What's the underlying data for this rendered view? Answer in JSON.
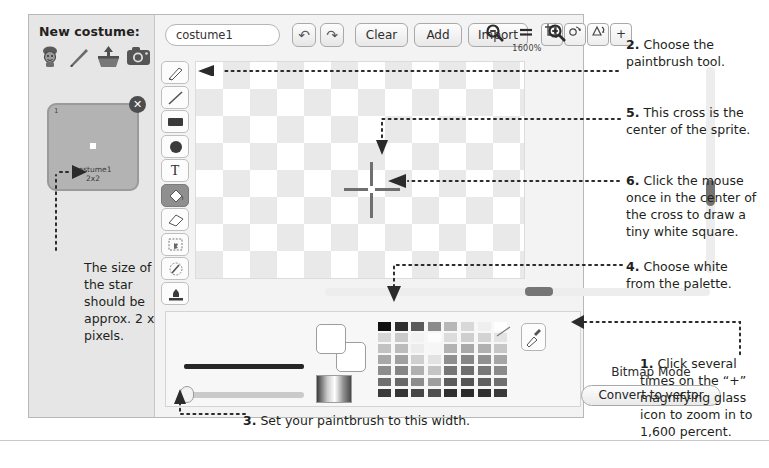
{
  "panel": {
    "new_costume_label": "New costume:",
    "icons": [
      {
        "name": "costume-library-icon",
        "label": "Choose costume from library"
      },
      {
        "name": "paint-costume-icon",
        "label": "Paint new costume"
      },
      {
        "name": "upload-costume-icon",
        "label": "Upload costume from file"
      },
      {
        "name": "camera-costume-icon",
        "label": "New costume from camera"
      }
    ],
    "thumbnail": {
      "number": "1",
      "name": "costume1",
      "size": "2x2",
      "delete_label": "✕"
    },
    "size_note": "The size of the star should be approx. 2 x 2 pixels."
  },
  "toolbar": {
    "costume_name_value": "costume1",
    "costume_name_placeholder": "costume1",
    "undo_label": "↶",
    "redo_label": "↷",
    "clear_label": "Clear",
    "add_label": "Add",
    "import_label": "Import",
    "crop_label": "⌧",
    "flip_h_label": "↺",
    "flip_v_label": "↻",
    "center_label": "+"
  },
  "tools": [
    {
      "id": "paintbrush",
      "label": "Paintbrush",
      "selected": false,
      "glyph": "brush"
    },
    {
      "id": "line",
      "label": "Line",
      "selected": false,
      "glyph": "line"
    },
    {
      "id": "rectangle",
      "label": "Rectangle",
      "selected": false,
      "glyph": "rect"
    },
    {
      "id": "ellipse",
      "label": "Ellipse",
      "selected": false,
      "glyph": "ellipse"
    },
    {
      "id": "text",
      "label": "Text",
      "selected": false,
      "glyph": "T"
    },
    {
      "id": "fill",
      "label": "Fill with color",
      "selected": true,
      "glyph": "bucket"
    },
    {
      "id": "eraser",
      "label": "Eraser",
      "selected": false,
      "glyph": "eraser"
    },
    {
      "id": "select",
      "label": "Select",
      "selected": false,
      "glyph": "select"
    },
    {
      "id": "magic-wand",
      "label": "Select and duplicate",
      "selected": false,
      "glyph": "wand"
    },
    {
      "id": "stamp",
      "label": "Stamp",
      "selected": false,
      "glyph": "stamp"
    }
  ],
  "canvas": {
    "zoom_level": "1600%",
    "mode_label": "Bitmap Mode",
    "convert_label": "Convert to vector",
    "zoom_out_label": "−",
    "zoom_reset_label": "=",
    "zoom_in_label": "+"
  },
  "palette": {
    "colors": [
      [
        "#111111",
        "#2e2e2e",
        "#5b5b5b",
        "#8a8a8a",
        "#b7b7b7",
        "#d8d8d8",
        "#efefef",
        "#ffffff"
      ],
      [
        "#d6d6d6",
        "#c9c9c9",
        "#f2f2f2",
        "#fdfdfd",
        "#dcdcdc",
        "#cfcfcf",
        "#d3d3d3",
        "#e3e3e3"
      ],
      [
        "#c2c2c2",
        "#bcbcbc",
        "#ececec",
        "#f6f6f6",
        "#b3b3b3",
        "#a9a9a9",
        "#b0b0b0",
        "#c6c6c6"
      ],
      [
        "#a8a8a8",
        "#a0a0a0",
        "#cfcfcf",
        "#e2e2e2",
        "#8f8f8f",
        "#868686",
        "#909090",
        "#a6a6a6"
      ],
      [
        "#8d8d8d",
        "#858585",
        "#b0b0b0",
        "#c4c4c4",
        "#767676",
        "#6e6e6e",
        "#787878",
        "#8b8b8b"
      ],
      [
        "#6f6f6f",
        "#686868",
        "#8d8d8d",
        "#9e9e9e",
        "#5c5c5c",
        "#555555",
        "#5f5f5f",
        "#6f6f6f"
      ],
      [
        "#3a3a3a",
        "#343434",
        "#464646",
        "#4f4f4f",
        "#2f2f2f",
        "#2b2b2b",
        "#303030",
        "#3a3a3a"
      ]
    ],
    "no_color_label": "no color",
    "dropper_label": "Eyedropper"
  },
  "annotations": {
    "step2": {
      "num": "2.",
      "text": " Choose the paintbrush tool."
    },
    "step5": {
      "num": "5.",
      "text": " This cross is the center of the sprite."
    },
    "step6": {
      "num": "6.",
      "text": " Click the mouse once in the center of the cross to draw a tiny white  square."
    },
    "step4": {
      "num": "4.",
      "text": " Choose white from the palette."
    },
    "step1": {
      "num": "1.",
      "text": " Click several times on the “+” magnifying glass icon to zoom in to 1,600 percent."
    },
    "step3": {
      "num": "3.",
      "text": " Set your paintbrush to this width."
    }
  },
  "colors": {
    "ink": "#231f20",
    "panel_bg": "#e6e6e6",
    "editor_bg": "#f3f3f3",
    "selected_tool": "#8f8f8f"
  }
}
